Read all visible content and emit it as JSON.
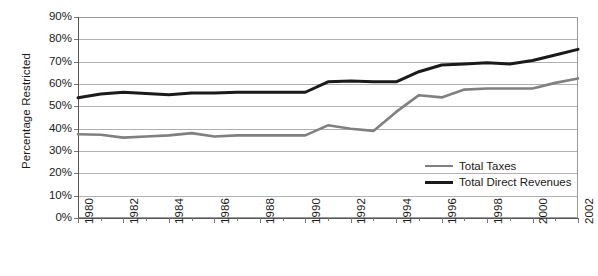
{
  "chart_data": {
    "type": "line",
    "title": "",
    "subtitle": "",
    "xlabel": "",
    "ylabel": "Percentage Restricted",
    "grid": true,
    "grid_axis": "y",
    "legend_position": "inside-bottom-right",
    "xlim": [
      1980,
      2002
    ],
    "ylim": [
      0,
      90
    ],
    "y_tick_step": 10,
    "x_tick_step": 2,
    "x_minor_tick_step": 1,
    "y_tick_labels": [
      "90%",
      "80%",
      "70%",
      "60%",
      "50%",
      "40%",
      "30%",
      "20%",
      "10%",
      "0%"
    ],
    "y_tick_values": [
      90,
      80,
      70,
      60,
      50,
      40,
      30,
      20,
      10,
      0
    ],
    "x_tick_labels": [
      "1980",
      "1982",
      "1984",
      "1986",
      "1988",
      "1990",
      "1992",
      "1994",
      "1996",
      "1998",
      "2000",
      "2002"
    ],
    "x_tick_values": [
      1980,
      1982,
      1984,
      1986,
      1988,
      1990,
      1992,
      1994,
      1996,
      1998,
      2000,
      2002
    ],
    "x": [
      1980,
      1981,
      1982,
      1983,
      1984,
      1985,
      1986,
      1987,
      1988,
      1989,
      1990,
      1991,
      1992,
      1993,
      1994,
      1995,
      1996,
      1997,
      1998,
      1999,
      2000,
      2001,
      2002
    ],
    "series": [
      {
        "name": "Total Taxes",
        "color": "#808080",
        "width": 2.6,
        "values": [
          37.5,
          37.3,
          36.0,
          36.5,
          37.0,
          38.0,
          36.5,
          37.0,
          37.0,
          37.0,
          37.0,
          41.5,
          40.0,
          39.0,
          47.5,
          55.0,
          54.0,
          57.5,
          58.0,
          58.0,
          58.0,
          60.5,
          62.5
        ]
      },
      {
        "name": "Total Direct Revenues",
        "color": "#1a1a1a",
        "width": 3.0,
        "values": [
          53.8,
          55.5,
          56.3,
          55.8,
          55.2,
          56.0,
          56.0,
          56.3,
          56.3,
          56.3,
          56.3,
          61.0,
          61.3,
          61.0,
          61.0,
          65.5,
          68.5,
          69.0,
          69.5,
          69.0,
          70.5,
          73.0,
          75.5
        ]
      }
    ],
    "legend": [
      {
        "label": "Total Taxes",
        "color": "#808080",
        "width": 2.6
      },
      {
        "label": "Total Direct Revenues",
        "color": "#1a1a1a",
        "width": 3.2
      }
    ],
    "style": {
      "background": "#ffffff",
      "plot_background": "#ffffff",
      "grid_color": "#b0b0b0",
      "frame_color": "#9a9a9a",
      "axis_color": "#777777",
      "text_color": "#1a1a1a"
    }
  }
}
